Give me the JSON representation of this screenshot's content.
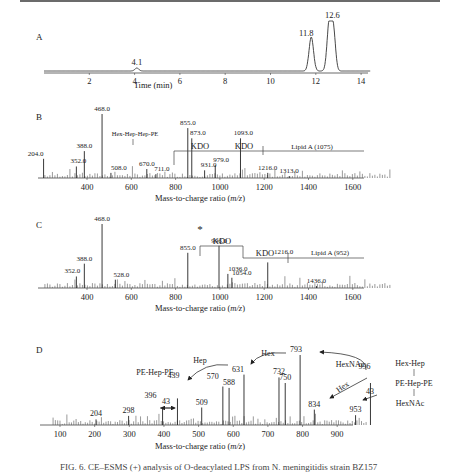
{
  "figure": {
    "caption": "FIG. 6. CE–ESMS (+) analysis of O-deacylated LPS from N. meningitidis strain BZ157"
  },
  "chart_data": [
    {
      "panel": "A",
      "type": "line",
      "title": "",
      "xlabel": "Time (min)",
      "ylabel": "",
      "xlim": [
        0,
        14.5
      ],
      "xticks": [
        2,
        4,
        6,
        8,
        10,
        12,
        14
      ],
      "grid": false,
      "peaks": [
        {
          "x": 4.1,
          "label": "4.1",
          "rel_height": 0.06
        },
        {
          "x": 11.8,
          "label": "11.8",
          "rel_height": 0.68
        },
        {
          "x": 12.6,
          "label": "12.6",
          "rel_height": 1.0
        }
      ]
    },
    {
      "panel": "B",
      "type": "bar",
      "xlabel": "Mass-to-charge ratio (m/z)",
      "xlim": [
        200,
        1780
      ],
      "xticks": [
        400,
        600,
        800,
        1000,
        1200,
        1400,
        1600
      ],
      "labeled_peaks": [
        {
          "x": 204.0,
          "label": "204.0",
          "rel": 0.3
        },
        {
          "x": 352.0,
          "label": "352.0",
          "rel": 0.18
        },
        {
          "x": 388.0,
          "label": "388.0",
          "rel": 0.42
        },
        {
          "x": 468.0,
          "label": "468.0",
          "rel": 1.0
        },
        {
          "x": 508.0,
          "label": "508.0",
          "rel": 0.08
        },
        {
          "x": 670.0,
          "label": "670.0",
          "rel": 0.14
        },
        {
          "x": 711.0,
          "label": "711.0",
          "rel": 0.06
        },
        {
          "x": 855.0,
          "label": "855.0",
          "rel": 0.78
        },
        {
          "x": 873.0,
          "label": "873.0",
          "rel": 0.62
        },
        {
          "x": 931.0,
          "label": "931.0",
          "rel": 0.12
        },
        {
          "x": 979.0,
          "label": "979.0",
          "rel": 0.2
        },
        {
          "x": 1093.0,
          "label": "1093.0",
          "rel": 0.62
        },
        {
          "x": 1216.0,
          "label": "1216.0",
          "rel": 0.08
        },
        {
          "x": 1313.0,
          "label": "1313.0",
          "rel": 0.03
        }
      ],
      "annotations": [
        "Hex-Hep-Hep-PE",
        "KDO",
        "KDO",
        "Lipid A (1075)"
      ]
    },
    {
      "panel": "C",
      "type": "bar",
      "xlabel": "Mass-to-charge ratio (m/z)",
      "xlim": [
        200,
        1780
      ],
      "xticks": [
        400,
        600,
        800,
        1000,
        1200,
        1400,
        1600
      ],
      "labeled_peaks": [
        {
          "x": 352.0,
          "label": "352.0",
          "rel": 0.18
        },
        {
          "x": 388.0,
          "label": "388.0",
          "rel": 0.38
        },
        {
          "x": 468.0,
          "label": "468.0",
          "rel": 1.0
        },
        {
          "x": 528.0,
          "label": "528.0",
          "rel": 0.13
        },
        {
          "x": 855.0,
          "label": "855.0",
          "rel": 0.55
        },
        {
          "x": 996.0,
          "label": "996.0",
          "rel": 0.66,
          "marker": "*"
        },
        {
          "x": 1036.0,
          "label": "1036.0",
          "rel": 0.22
        },
        {
          "x": 1054.0,
          "label": "1054.0",
          "rel": 0.16
        },
        {
          "x": 1216.0,
          "label": "1216.0",
          "rel": 0.4
        },
        {
          "x": 1436.0,
          "label": "1436.0",
          "rel": 0.03
        }
      ],
      "annotations": [
        "*",
        "KDO",
        "KDO",
        "Lipid A (952)"
      ]
    },
    {
      "panel": "D",
      "type": "bar",
      "xlabel": "Mass-to-charge ratio (m/z)",
      "xlim": [
        70,
        1000
      ],
      "xticks": [
        100,
        200,
        300,
        400,
        500,
        600,
        700,
        800,
        900
      ],
      "labeled_peaks": [
        {
          "x": 204,
          "label": "204",
          "rel": 0.08
        },
        {
          "x": 298,
          "label": "298",
          "rel": 0.13
        },
        {
          "x": 396,
          "label": "396",
          "rel": 0.25
        },
        {
          "x": 439,
          "label": "439",
          "rel": 0.38
        },
        {
          "x": 509,
          "label": "509",
          "rel": 0.25
        },
        {
          "x": 570,
          "label": "570",
          "rel": 0.55
        },
        {
          "x": 588,
          "label": "588",
          "rel": 0.53
        },
        {
          "x": 631,
          "label": "631",
          "rel": 0.72
        },
        {
          "x": 732,
          "label": "732",
          "rel": 0.68
        },
        {
          "x": 750,
          "label": "750",
          "rel": 0.6
        },
        {
          "x": 793,
          "label": "793",
          "rel": 1.0
        },
        {
          "x": 834,
          "label": "834",
          "rel": 0.22
        },
        {
          "x": 953,
          "label": "953",
          "rel": 0.14
        },
        {
          "x": 996,
          "label": "996",
          "rel": 0.6
        }
      ],
      "annotations": [
        "PE-Hep-PE",
        "Hep",
        "Hex",
        "HexNAc",
        "Hex",
        "43",
        "43"
      ],
      "structure": [
        "Hex-Hep",
        "PE-Hep-PE",
        "HexNAc"
      ]
    }
  ],
  "panels": {
    "A": {
      "letter": "A",
      "xlabel": "Time (min)",
      "ticks": [
        "2",
        "4",
        "6",
        "8",
        "10",
        "12",
        "14"
      ],
      "peak_labels": [
        "4.1",
        "11.8",
        "12.6"
      ]
    },
    "B": {
      "letter": "B",
      "xlabel": "Mass-to-charge ratio (",
      "xlabel_italic": "m/z",
      "xlabel_end": ")",
      "ticks": [
        "400",
        "600",
        "800",
        "1000",
        "1200",
        "1400",
        "1600"
      ],
      "hex_label": "Hex-Hep-Hep-PE",
      "kdo1": "KDO",
      "kdo2": "KDO",
      "lipid": "Lipid A (1075)"
    },
    "C": {
      "letter": "C",
      "xlabel": "Mass-to-charge ratio (",
      "xlabel_italic": "m/z",
      "xlabel_end": ")",
      "ticks": [
        "400",
        "600",
        "800",
        "1000",
        "1200",
        "1400",
        "1600"
      ],
      "star": "*",
      "kdo1": "KDO",
      "kdo2": "KDO",
      "lipid": "Lipid A (952)"
    },
    "D": {
      "letter": "D",
      "xlabel": "Mass-to-charge ratio (",
      "xlabel_italic": "m/z",
      "xlabel_end": ")",
      "ticks": [
        "100",
        "200",
        "300",
        "400",
        "500",
        "600",
        "700",
        "800",
        "900"
      ],
      "pe_hep_pe": "PE-Hep-PE",
      "hep": "Hep",
      "hex_top": "Hex",
      "hexnac": "HexNAc",
      "hex_diag": "Hex",
      "d43a": "43",
      "d43b": "43",
      "struct_top": "Hex-Hep",
      "struct_mid": "PE-Hep-PE",
      "struct_bot": "HexNAc"
    }
  }
}
